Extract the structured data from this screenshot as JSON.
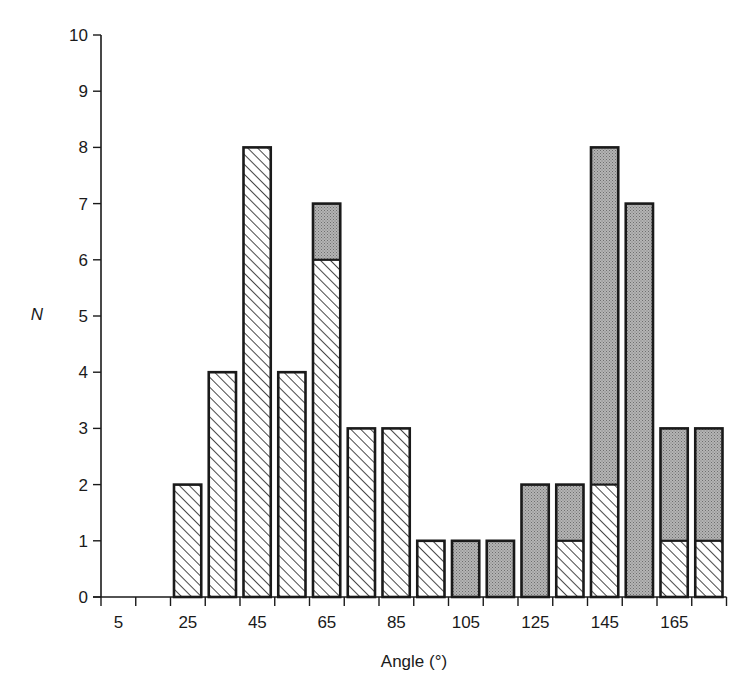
{
  "chart_data": {
    "type": "bar",
    "stacked": true,
    "title": "",
    "xlabel": "Angle (°)",
    "ylabel": "N",
    "ylim": [
      0,
      10
    ],
    "xlim": [
      0,
      180
    ],
    "bin_width": 10,
    "grid": false,
    "legend": null,
    "y_ticks": [
      0,
      1,
      2,
      3,
      4,
      5,
      6,
      7,
      8,
      9,
      10
    ],
    "x_tick_labels": [
      "5",
      "25",
      "45",
      "65",
      "85",
      "105",
      "125",
      "145",
      "165"
    ],
    "categories": [
      5,
      15,
      25,
      35,
      45,
      55,
      65,
      75,
      85,
      95,
      105,
      115,
      125,
      135,
      145,
      155,
      165,
      175
    ],
    "series": [
      {
        "name": "hatched",
        "pattern": "diagonal-hatch",
        "values": [
          0,
          0,
          2,
          4,
          8,
          4,
          6,
          3,
          3,
          1,
          0,
          0,
          0,
          1,
          2,
          0,
          1,
          1
        ]
      },
      {
        "name": "shaded",
        "pattern": "stipple-gray",
        "color": "#a8a8a8",
        "values": [
          0,
          0,
          0,
          0,
          0,
          0,
          1,
          0,
          0,
          0,
          1,
          1,
          2,
          1,
          6,
          7,
          2,
          2
        ]
      }
    ],
    "totals": [
      0,
      0,
      2,
      4,
      8,
      4,
      7,
      3,
      3,
      1,
      1,
      1,
      2,
      2,
      8,
      7,
      3,
      3
    ]
  },
  "colors": {
    "ink": "#1a1a1a",
    "shaded_fill": "#a9a9a9",
    "background": "#ffffff"
  }
}
